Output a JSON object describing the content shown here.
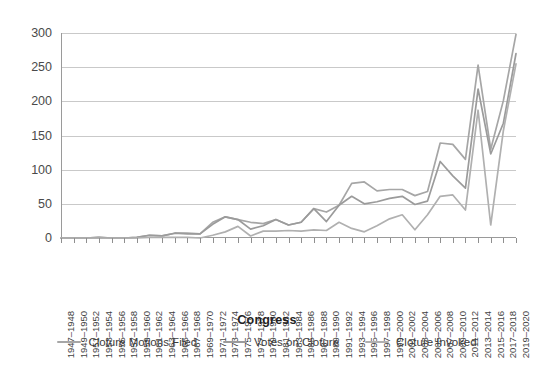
{
  "chart_data": {
    "type": "line",
    "title": "",
    "xlabel": "Congress",
    "ylabel": "",
    "ylim": [
      0,
      300
    ],
    "yticks": [
      0,
      50,
      100,
      150,
      200,
      250,
      300
    ],
    "grid": true,
    "legend_position": "bottom",
    "categories": [
      "1947–1948",
      "1949–1950",
      "1951–1952",
      "1953–1954",
      "1955–1956",
      "1957–1958",
      "1959–1960",
      "1961–1962",
      "1963–1964",
      "1965–1966",
      "1967–1968",
      "1969–1970",
      "1971–1972",
      "1973–1974",
      "1975–1976",
      "1977–1978",
      "1979–1980",
      "1981–1982",
      "1983–1984",
      "1985–1986",
      "1987–1988",
      "1989–1990",
      "1991–1992",
      "1993–1994",
      "1995–1996",
      "1997–1998",
      "1999–2000",
      "2001–2002",
      "2003–2004",
      "2005–2006",
      "2007–2008",
      "2009–2010",
      "2011–2012",
      "2013–2014",
      "2015–2016",
      "2017–2018",
      "2019–2020"
    ],
    "series": [
      {
        "name": "Cloture Motions Filed",
        "color": "#a6a6a6",
        "values": [
          0,
          0,
          0,
          1,
          0,
          0,
          1,
          4,
          3,
          7,
          7,
          6,
          23,
          31,
          27,
          23,
          21,
          27,
          19,
          23,
          43,
          38,
          48,
          80,
          82,
          69,
          71,
          71,
          62,
          68,
          139,
          137,
          115,
          253,
          130,
          201,
          298
        ]
      },
      {
        "name": "Votes on Cloture",
        "color": "#9b9b9b",
        "values": [
          0,
          0,
          0,
          1,
          0,
          0,
          1,
          4,
          3,
          7,
          6,
          6,
          20,
          31,
          27,
          13,
          18,
          27,
          19,
          23,
          43,
          24,
          48,
          61,
          50,
          53,
          58,
          61,
          49,
          54,
          112,
          91,
          73,
          218,
          123,
          168,
          270
        ]
      },
      {
        "name": "Cloture Invoked",
        "color": "#b0b0b0",
        "values": [
          0,
          0,
          0,
          0,
          0,
          0,
          0,
          1,
          1,
          1,
          1,
          0,
          4,
          9,
          17,
          3,
          10,
          10,
          11,
          10,
          12,
          11,
          23,
          14,
          9,
          18,
          28,
          34,
          12,
          34,
          61,
          63,
          41,
          187,
          19,
          157,
          255
        ]
      }
    ]
  },
  "legend": {
    "items": [
      {
        "label": "Cloture Motions Filed"
      },
      {
        "label": "Votes on Cloture"
      },
      {
        "label": "Cloture Invoked"
      }
    ]
  }
}
